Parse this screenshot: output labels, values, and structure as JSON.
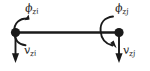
{
  "figure": {
    "kind": "beam-element-dof-diagram",
    "background_color": "#ffffff",
    "ink_color": "#1a1a1a",
    "width": 150,
    "height": 71
  },
  "beam": {
    "name": "beam-member",
    "start_node_label": "i",
    "end_node_label": "j",
    "orientation": "horizontal"
  },
  "labels": {
    "rotation_i": {
      "symbol": "ϕ",
      "subscript": "zi",
      "text": "ϕzi"
    },
    "rotation_j": {
      "symbol": "ϕ",
      "subscript": "zj",
      "text": "ϕzj"
    },
    "translation_i": {
      "symbol": "v",
      "subscript": "zi",
      "text": "vzi"
    },
    "translation_j": {
      "symbol": "v",
      "subscript": "zj",
      "text": "vzj"
    }
  },
  "arrows": {
    "moment_i": {
      "type": "curved-arrow",
      "direction": "counterclockwise-open-right"
    },
    "moment_j": {
      "type": "curved-arrow",
      "direction": "clockwise-open-left"
    },
    "force_i": {
      "type": "straight-arrow",
      "direction": "down"
    },
    "force_j": {
      "type": "straight-arrow",
      "direction": "down"
    }
  }
}
